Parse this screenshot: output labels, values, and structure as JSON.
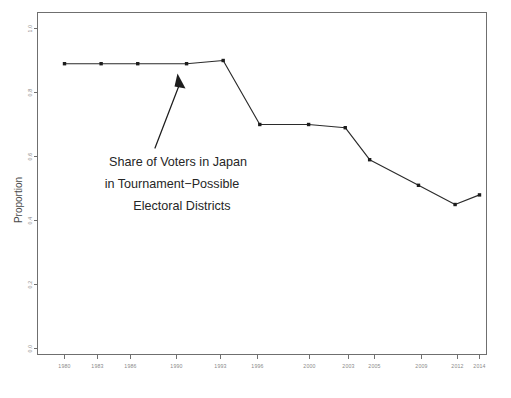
{
  "chart_data": {
    "type": "line",
    "title": "",
    "xlabel": "",
    "ylabel": "Proportion",
    "categories": [
      "1980",
      "1983",
      "1986",
      "1990",
      "1993",
      "1996",
      "2000",
      "2003",
      "2005",
      "2009",
      "2012",
      "2014"
    ],
    "x": [
      1980,
      1983,
      1986,
      1990,
      1993,
      1996,
      2000,
      2003,
      2005,
      2009,
      2012,
      2014
    ],
    "values": [
      0.89,
      0.89,
      0.89,
      0.89,
      0.9,
      0.7,
      0.7,
      0.69,
      0.59,
      0.51,
      0.45,
      0.48
    ],
    "series": [
      {
        "name": "Share of Voters in Tournament-Possible Electoral Districts",
        "values": [
          0.89,
          0.89,
          0.89,
          0.89,
          0.9,
          0.7,
          0.7,
          0.69,
          0.59,
          0.51,
          0.45,
          0.48
        ]
      }
    ],
    "ylim": [
      0.0,
      1.0
    ],
    "yticks": [
      0.0,
      0.2,
      0.4,
      0.6,
      0.8,
      1.0
    ],
    "ytick_labels": [
      "0.0",
      "0.2",
      "0.4",
      "0.6",
      "0.8",
      "1.0"
    ],
    "xtick_labels": [
      "1980",
      "1983",
      "1986",
      "1990",
      "1993",
      "1996",
      "2000",
      "2003",
      "2005",
      "2009",
      "2012",
      "2014"
    ],
    "grid": false,
    "legend": "none",
    "marker": "filled-square",
    "line_color": "#2b2b2b",
    "marker_color": "#1d1d1d",
    "axis_color": "#6f6f6f",
    "background_color": "#ffffff"
  },
  "annotation": {
    "line1": "Share of Voters in Japan",
    "line2": "in Tournament−Possible",
    "line3": "Electoral Districts",
    "arrow_points_to_year": "1990"
  },
  "axes": {
    "y_title": "Proportion"
  }
}
